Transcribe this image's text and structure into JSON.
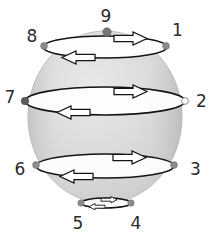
{
  "figure": {
    "background_color": "#ffffff",
    "sphere": {
      "name": "sphere",
      "center_x": 105,
      "center_y": 117,
      "radius_x": 77,
      "radius_y": 86,
      "fill_color": "#d9d9d9",
      "edge_shade_color": "#bdbdbd",
      "highlight_color": "#ebebeb",
      "outline_color": "#c0c0c0"
    },
    "loops": [
      {
        "id": "loop-top",
        "name": "latitude-loop-upper",
        "center_x": 105,
        "center_y": 47,
        "radius_x": 62,
        "radius_y": 11,
        "stroke_color": "#141414",
        "fill_color": "#ffffff",
        "left_node": "8",
        "right_node": "1",
        "arrow_forward_direction": "right",
        "arrow_backward_direction": "left"
      },
      {
        "id": "loop-equator",
        "name": "latitude-loop-equator",
        "center_x": 105,
        "center_y": 101,
        "radius_x": 80,
        "radius_y": 14,
        "stroke_color": "#141414",
        "fill_color": "#ffffff",
        "left_node": "7",
        "right_node": "2",
        "arrow_forward_direction": "right",
        "arrow_backward_direction": "left"
      },
      {
        "id": "loop-lower",
        "name": "latitude-loop-lower",
        "center_x": 105,
        "center_y": 166,
        "radius_x": 69,
        "radius_y": 12,
        "stroke_color": "#141414",
        "fill_color": "#ffffff",
        "left_node": "6",
        "right_node": "3",
        "arrow_forward_direction": "right",
        "arrow_backward_direction": "left"
      },
      {
        "id": "loop-bottom",
        "name": "latitude-loop-bottom",
        "center_x": 106,
        "center_y": 203,
        "radius_x": 25,
        "radius_y": 5,
        "stroke_color": "#141414",
        "fill_color": "#ffffff",
        "left_node": "5",
        "right_node": "4",
        "arrow_forward_direction": "right",
        "arrow_backward_direction": "left"
      }
    ],
    "nodes": [
      {
        "id": "1",
        "label": "1",
        "marker_x": 166,
        "marker_y": 46,
        "label_x": 172,
        "label_y": 36,
        "marker_style": "filled",
        "marker_color": "#8c8c8c",
        "marker_radius": 3.4
      },
      {
        "id": "2",
        "label": "2",
        "marker_x": 185,
        "marker_y": 101,
        "label_x": 196,
        "label_y": 104,
        "marker_style": "open",
        "marker_color": "#ffffff",
        "marker_radius": 3.4
      },
      {
        "id": "3",
        "label": "3",
        "marker_x": 174,
        "marker_y": 165,
        "label_x": 190,
        "label_y": 172,
        "marker_style": "filled",
        "marker_color": "#8c8c8c",
        "marker_radius": 3.4
      },
      {
        "id": "4",
        "label": "4",
        "marker_x": 131,
        "marker_y": 203,
        "label_x": 132,
        "label_y": 227,
        "marker_style": "filled",
        "marker_color": "#8c8c8c",
        "marker_radius": 3.2
      },
      {
        "id": "5",
        "label": "5",
        "marker_x": 81,
        "marker_y": 203,
        "label_x": 74,
        "label_y": 227,
        "marker_style": "filled",
        "marker_color": "#8c8c8c",
        "marker_radius": 3.2
      },
      {
        "id": "6",
        "label": "6",
        "marker_x": 36,
        "marker_y": 165,
        "label_x": 21,
        "label_y": 172,
        "marker_style": "filled",
        "marker_color": "#8c8c8c",
        "marker_radius": 3.4
      },
      {
        "id": "7",
        "label": "7",
        "marker_x": 25,
        "marker_y": 101,
        "label_x": 8,
        "label_y": 99,
        "marker_style": "filled",
        "marker_color": "#5e5e5e",
        "marker_radius": 3.8
      },
      {
        "id": "8",
        "label": "8",
        "marker_x": 44,
        "marker_y": 46,
        "label_x": 28,
        "label_y": 40,
        "marker_style": "filled",
        "marker_color": "#8c8c8c",
        "marker_radius": 3.4
      },
      {
        "id": "9",
        "label": "9",
        "marker_x": 107,
        "marker_y": 32,
        "label_x": 100,
        "label_y": 20,
        "marker_style": "filled",
        "marker_color": "#767676",
        "marker_radius": 4.2
      }
    ],
    "arrow_style": {
      "fill_color": "#ffffff",
      "stroke_color": "#141414",
      "description": "hollow block arrow"
    }
  }
}
